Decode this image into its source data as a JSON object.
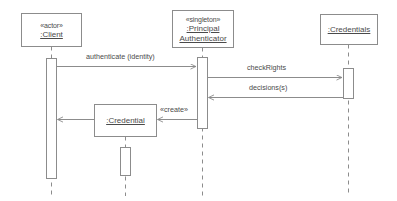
{
  "diagram": {
    "type": "uml-sequence-diagram",
    "background_color": "#ffffff",
    "line_color": "#8c8c8c",
    "text_color": "#4a4a4a",
    "width": 397,
    "height": 201
  },
  "lifelines": [
    {
      "id": "client",
      "stereotype": "«actor»",
      "name": ":Client",
      "box": {
        "x": 21,
        "y": 13,
        "w": 60,
        "h": 33
      },
      "lifeline_x": 51,
      "activation": {
        "x": 46,
        "y": 58,
        "w": 10,
        "h": 120
      }
    },
    {
      "id": "authenticator",
      "stereotype": "«singleton»",
      "name_line1": ":Principal",
      "name_line2": "Authenticator",
      "name": ":Principal Authenticator",
      "box": {
        "x": 172,
        "y": 10,
        "w": 61,
        "h": 37
      },
      "lifeline_x": 202,
      "activation": {
        "x": 197,
        "y": 57,
        "w": 10,
        "h": 71
      }
    },
    {
      "id": "credentials",
      "stereotype": "",
      "name": ":Credentials",
      "box": {
        "x": 320,
        "y": 14,
        "w": 57,
        "h": 30
      },
      "lifeline_x": 348,
      "activation": {
        "x": 343,
        "y": 68,
        "w": 10,
        "h": 30
      }
    }
  ],
  "created_objects": [
    {
      "id": "credential",
      "name": ":Credential",
      "box": {
        "x": 94,
        "y": 104,
        "w": 62,
        "h": 32
      },
      "lifeline_x": 125,
      "activation": {
        "x": 120,
        "y": 147,
        "w": 10,
        "h": 28
      }
    }
  ],
  "messages": [
    {
      "id": "authenticate",
      "label": "authenticate (identity)",
      "from": "client",
      "to": "authenticator",
      "direction": "right",
      "y": 66,
      "label_x": 86,
      "label_y": 55
    },
    {
      "id": "check-rights",
      "label": "checkRights",
      "from": "authenticator",
      "to": "credentials",
      "direction": "right",
      "y": 77,
      "label_x": 247,
      "label_y": 66
    },
    {
      "id": "decisions",
      "label": "decisions(s)",
      "from": "credentials",
      "to": "authenticator",
      "direction": "left",
      "y": 97,
      "label_x": 248,
      "label_y": 86
    },
    {
      "id": "create",
      "label": "«create»",
      "from": "authenticator",
      "to": "credential",
      "direction": "left",
      "y": 119,
      "label_x": 178,
      "label_y": 108
    },
    {
      "id": "return-credential",
      "label": "",
      "from": "credential",
      "to": "client",
      "direction": "left",
      "y": 119,
      "label_x": 0,
      "label_y": 0
    }
  ]
}
